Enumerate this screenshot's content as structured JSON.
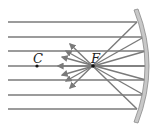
{
  "diagram": {
    "labels": {
      "center": "C",
      "focus": "F"
    },
    "colors": {
      "ray": "#7a7a7a",
      "mirror_fill": "#c8c8c8",
      "mirror_edge": "#8a8a8a",
      "text": "#222222",
      "point": "#111111"
    },
    "points": {
      "center": {
        "x": 37,
        "y": 66
      },
      "focus": {
        "x": 93,
        "y": 66
      }
    },
    "incident_rays_y": [
      22,
      37,
      51,
      66,
      80,
      95,
      109
    ],
    "ray_count": 7
  }
}
